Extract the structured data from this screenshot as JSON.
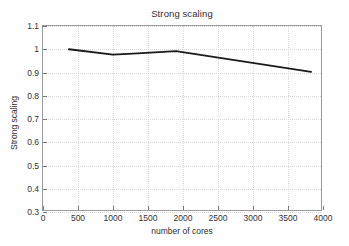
{
  "chart_data": {
    "type": "line",
    "title": "Strong scaling",
    "xlabel": "number of cores",
    "ylabel": "Strong scaling",
    "xlim": [
      0,
      4000
    ],
    "ylim": [
      0.3,
      1.1
    ],
    "xticks": [
      0,
      500,
      1000,
      1500,
      2000,
      2500,
      3000,
      3500,
      4000
    ],
    "xtick_labels": [
      "0",
      "500",
      "1000",
      "1500",
      "2000",
      "2500",
      "3000",
      "3500",
      "4000"
    ],
    "yticks": [
      0.3,
      0.4,
      0.5,
      0.6,
      0.7,
      0.8,
      0.9,
      1.0,
      1.1
    ],
    "ytick_labels": [
      "0.3",
      "0.4",
      "0.5",
      "0.6",
      "0.7",
      "0.8",
      "0.9",
      "1",
      "1.1"
    ],
    "grid": true,
    "legend": null,
    "series": [
      {
        "name": "Strong scaling",
        "color": "#1a1a1a",
        "line_width": 1.8,
        "x": [
          370,
          1000,
          1350,
          1900,
          3830
        ],
        "y": [
          1.0,
          0.977,
          0.982,
          0.992,
          0.903
        ]
      }
    ]
  }
}
